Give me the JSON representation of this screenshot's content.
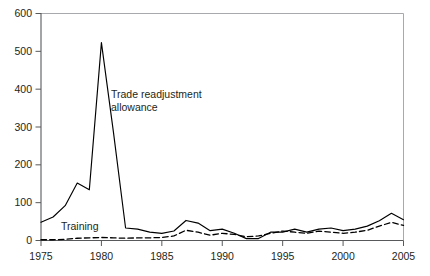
{
  "chart_data": {
    "type": "line",
    "title": "",
    "subtitle": "",
    "xlabel": "",
    "ylabel": "",
    "xlim": [
      1975,
      2005
    ],
    "ylim": [
      0,
      600
    ],
    "grid": false,
    "legend_position": "inline-annotations",
    "y_ticks": [
      0,
      100,
      200,
      300,
      400,
      500,
      600
    ],
    "y_tick_labels": [
      "0",
      "100",
      "200",
      "300",
      "400",
      "500",
      "600"
    ],
    "x_ticks": [
      1975,
      1980,
      1985,
      1990,
      1995,
      2000,
      2005
    ],
    "x_tick_labels": [
      "1975",
      "1980",
      "1985",
      "1990",
      "1995",
      "2000",
      "2005"
    ],
    "x": [
      1975,
      1976,
      1977,
      1978,
      1979,
      1980,
      1981,
      1982,
      1983,
      1984,
      1985,
      1986,
      1987,
      1988,
      1989,
      1990,
      1991,
      1992,
      1993,
      1994,
      1995,
      1996,
      1997,
      1998,
      1999,
      2000,
      2001,
      2002,
      2003,
      2004,
      2005
    ],
    "series": [
      {
        "name": "Trade readjustment allowance",
        "style": "solid",
        "color": "#000000",
        "values": [
          48,
          62,
          92,
          152,
          134,
          523,
          285,
          33,
          30,
          22,
          19,
          25,
          53,
          46,
          26,
          30,
          19,
          5,
          5,
          22,
          22,
          30,
          22,
          30,
          33,
          26,
          30,
          38,
          52,
          72,
          55
        ]
      },
      {
        "name": "Training",
        "style": "dashed",
        "color": "#000000",
        "values": [
          2,
          2,
          3,
          6,
          7,
          8,
          7,
          6,
          7,
          7,
          8,
          12,
          27,
          22,
          14,
          19,
          16,
          10,
          12,
          19,
          25,
          22,
          19,
          25,
          22,
          19,
          22,
          27,
          38,
          48,
          40
        ]
      }
    ],
    "annotations": [
      {
        "id": "trade-readjustment-allowance-label",
        "lines": [
          "Trade readjustment",
          "allowance"
        ],
        "x_px": 111,
        "y_px": 98
      },
      {
        "id": "training-label",
        "lines": [
          "Training"
        ],
        "x_px": 61,
        "y_px": 230
      }
    ]
  },
  "colors": {
    "series": "#000000",
    "axis": "#58595b",
    "frame": "#a7a9ac",
    "text": "#231f20",
    "background": "#ffffff"
  }
}
